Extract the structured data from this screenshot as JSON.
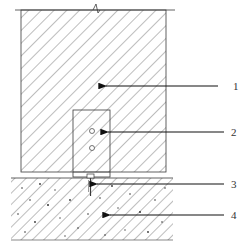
{
  "diagram": {
    "type": "cross-section",
    "colors": {
      "line": "#3a3a3a",
      "hatch": "#555555",
      "background": "#ffffff"
    },
    "components": [
      {
        "id": "1",
        "label": "1",
        "part": "wall"
      },
      {
        "id": "2",
        "label": "2",
        "part": "bracket"
      },
      {
        "id": "3",
        "label": "3",
        "part": "bolt"
      },
      {
        "id": "4",
        "label": "4",
        "part": "concrete-slab"
      }
    ]
  }
}
